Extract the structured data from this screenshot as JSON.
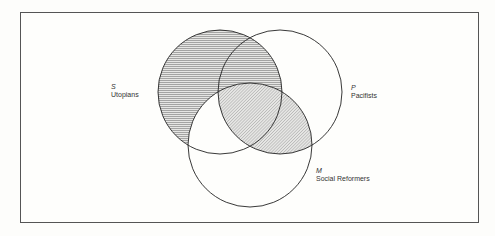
{
  "diagram": {
    "type": "venn",
    "sets": [
      {
        "letter": "S",
        "name": "Utopians",
        "cx": 220,
        "cy": 92,
        "r": 62
      },
      {
        "letter": "P",
        "name": "Pacifists",
        "cx": 280,
        "cy": 92,
        "r": 62
      },
      {
        "letter": "M",
        "name": "Social Reformers",
        "cx": 250,
        "cy": 145,
        "r": 62
      }
    ],
    "shading": {
      "S_only": "horizontal",
      "S_and_P_not_M": "horizontal",
      "S_and_P_and_M": "diagonal",
      "P_and_M_not_S": "diagonal",
      "S_and_M_not_P": "none",
      "P_only": "none",
      "M_only": "none"
    },
    "colors": {
      "stroke": "#222222",
      "hatch": "#555555",
      "frame": "#555555",
      "background": "#fefefc"
    }
  },
  "labels": {
    "s": {
      "letter": "S",
      "name": "Utopians"
    },
    "p": {
      "letter": "P",
      "name": "Pacifists"
    },
    "m": {
      "letter": "M",
      "name": "Social Reformers"
    }
  }
}
